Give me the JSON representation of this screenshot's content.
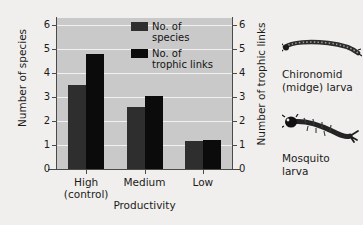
{
  "chart_data": {
    "type": "bar",
    "title": "",
    "categories": [
      "High\n(control)",
      "Medium",
      "Low"
    ],
    "category_labels": [
      {
        "line1": "High",
        "line2": "(control)"
      },
      {
        "line1": "Medium",
        "line2": ""
      },
      {
        "line1": "Low",
        "line2": ""
      }
    ],
    "series": [
      {
        "name": "No. of species",
        "values": [
          3.5,
          2.6,
          1.15
        ],
        "color": "#2e2e2e",
        "axis": "left"
      },
      {
        "name": "No. of trophic links",
        "values": [
          4.8,
          3.05,
          1.2
        ],
        "color": "#0b0b0b",
        "axis": "right"
      }
    ],
    "xlabel": "Productivity",
    "ylabel": "Number of species",
    "ylabel_right": "Number of trophic links",
    "ylim": [
      0,
      6.3
    ],
    "ylim_right": [
      0,
      6.3
    ],
    "yticks": [
      0,
      1,
      2,
      3,
      4,
      5,
      6
    ],
    "yticks_right": [
      0,
      1,
      2,
      3,
      4,
      5,
      6
    ],
    "grid": true,
    "legend_position": "top-center",
    "plot_background": "#c9c9c9",
    "figure_background": "#f1efed"
  },
  "legend": {
    "items": [
      {
        "label": "No. of species",
        "color": "#2e2e2e"
      },
      {
        "label": "No. of trophic links",
        "color": "#0b0b0b"
      }
    ]
  },
  "axes": {
    "left_title": "Number of species",
    "right_title": "Number of trophic links",
    "x_title": "Productivity",
    "left_ticks": [
      "6",
      "5",
      "4",
      "3",
      "2",
      "1",
      "0"
    ],
    "right_ticks": [
      "6",
      "5",
      "4",
      "3",
      "2",
      "1",
      "0"
    ]
  },
  "illustrations": [
    {
      "name": "chironomid-midge-larva",
      "caption_line1": "Chironomid",
      "caption_line2": "(midge) larva"
    },
    {
      "name": "mosquito-larva",
      "caption_line1": "Mosquito",
      "caption_line2": "larva"
    }
  ]
}
